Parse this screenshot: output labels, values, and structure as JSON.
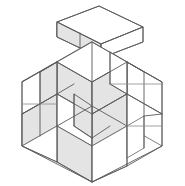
{
  "figure": {
    "style": {
      "background": "#ffffff",
      "stroke": "#5a5a5a",
      "stroke_soft": "#8a8a8a",
      "face_top": "#ffffff",
      "face_left": "#fbfbfb",
      "face_right": "#ebebeb",
      "face_shade": "#e4e4e4"
    },
    "canvas": {
      "width": 185,
      "height": 186
    }
  },
  "geometry": {
    "outer_hexagon": "M 92,42 L 162,82 L 162,146 L 92,182 L 22,146 L 22,82 Z",
    "detached_piece": {
      "top_face": "M 57,22 L 99,6 L 143,27 L 101,44 Z",
      "left_face": "M 57,22 L 57,37 L 101,58 L 101,44 Z",
      "right_face": "M 101,44 L 101,58 L 143,42 L 143,27 Z",
      "inner_divider": "M 80,33 L 80,48"
    },
    "assembly_paths": [
      "M 22,82 L 57,62 L 57,126 L 22,146 Z",
      "M 57,62 L 92,82 L 92,146 L 57,126 Z",
      "M 92,42 L 127,62 L 127,126 L 92,146 Z",
      "M 127,62 L 162,82 L 162,146 L 127,126 Z",
      "M 57,62 L 92,42 L 127,62 L 92,82 Z",
      "M 22,114 L 57,94 L 92,114 L 57,134 Z",
      "M 92,114 L 127,94 L 162,114 L 127,134 Z",
      "M 57,126 L 92,146 L 127,126 L 92,106 Z",
      "M 22,146 L 57,126 L 92,146 L 92,182 L 57,162 Z",
      "M 92,146 L 127,126 L 162,146 L 127,166 L 92,182 Z"
    ],
    "inner_edges": [
      "M 57,62 L 57,126",
      "M 92,42 L 92,182",
      "M 127,62 L 127,166",
      "M 22,114 L 57,94",
      "M 57,94 L 92,114",
      "M 92,114 L 127,94",
      "M 127,94 L 162,114",
      "M 22,82 L 57,62",
      "M 127,62 L 162,82",
      "M 40,72 L 40,136",
      "M 74,52 L 74,116",
      "M 110,52 L 110,116",
      "M 144,72 L 144,136",
      "M 57,126 L 92,106 L 127,126",
      "M 22,146 L 57,162 L 92,182",
      "M 92,182 L 127,166 L 162,146"
    ]
  },
  "pieces": [
    {
      "id": "piece-detached",
      "label": "detached-block",
      "position": "top-floating"
    },
    {
      "id": "piece-left-upper",
      "label": "left-upper-block",
      "position": "upper-left"
    },
    {
      "id": "piece-left-lower",
      "label": "left-lower-block",
      "position": "lower-left"
    },
    {
      "id": "piece-center",
      "label": "center-block",
      "position": "center"
    },
    {
      "id": "piece-right-upper",
      "label": "right-upper-block",
      "position": "upper-right"
    },
    {
      "id": "piece-right-lower",
      "label": "right-lower-block",
      "position": "lower-right"
    },
    {
      "id": "piece-bottom",
      "label": "bottom-block",
      "position": "bottom"
    }
  ]
}
